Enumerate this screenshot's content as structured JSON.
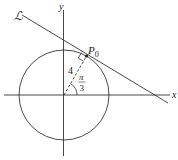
{
  "diagram": {
    "line_label": "ℒ",
    "point_label": "P",
    "point_subscript": "0",
    "x_axis_label": "x",
    "y_axis_label": "y",
    "radius_label": "4",
    "angle_numerator": "π",
    "angle_denominator": "3",
    "colors": {
      "stroke": "#333333",
      "background": "#ffffff"
    }
  }
}
